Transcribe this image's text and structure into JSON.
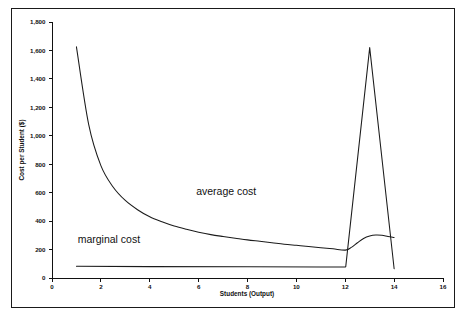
{
  "chart_data": {
    "type": "line",
    "title": "",
    "xlabel": "Students (Output)",
    "ylabel": "Cost per Student ($)",
    "xlim": [
      0,
      16
    ],
    "ylim": [
      0,
      1800
    ],
    "grid": false,
    "legend_position": "inline-annotation",
    "x_ticks": [
      0,
      2,
      4,
      6,
      8,
      10,
      12,
      14,
      16
    ],
    "x_tick_labels": [
      "0",
      "2",
      "4",
      "6",
      "8",
      "10",
      "12",
      "14",
      "16"
    ],
    "y_ticks": [
      0,
      200,
      400,
      600,
      800,
      1000,
      1200,
      1400,
      1600,
      1800
    ],
    "y_tick_labels": [
      "0",
      "200",
      "400",
      "600",
      "800",
      "1,000",
      "1,200",
      "1,400",
      "1,600",
      "1,800"
    ],
    "series": [
      {
        "name": "average cost",
        "annotation": "average cost",
        "color": "#1b1b1b",
        "x": [
          1,
          1.5,
          2,
          2.5,
          3,
          3.5,
          4,
          4.5,
          5,
          5.5,
          6,
          6.5,
          7,
          7.5,
          8,
          8.5,
          9,
          9.5,
          10,
          10.5,
          11,
          11.5,
          12,
          12.25,
          12.5,
          12.75,
          13,
          13.25,
          13.5,
          13.75,
          14
        ],
        "y": [
          1625,
          1080,
          790,
          640,
          545,
          480,
          430,
          395,
          365,
          342,
          322,
          305,
          292,
          280,
          268,
          258,
          248,
          238,
          230,
          222,
          213,
          205,
          196,
          215,
          248,
          278,
          295,
          302,
          300,
          292,
          285
        ]
      },
      {
        "name": "marginal cost",
        "annotation": "marginal cost",
        "color": "#1b1b1b",
        "x": [
          1,
          4,
          8,
          11,
          12,
          12.02,
          13,
          14
        ],
        "y": [
          82,
          80,
          79,
          78,
          77,
          80,
          1620,
          65
        ]
      }
    ],
    "annotations": [
      {
        "text": "average cost",
        "x_data": 5.9,
        "y_data": 585
      },
      {
        "text": "marginal cost",
        "x_data": 1.05,
        "y_data": 245
      }
    ]
  }
}
